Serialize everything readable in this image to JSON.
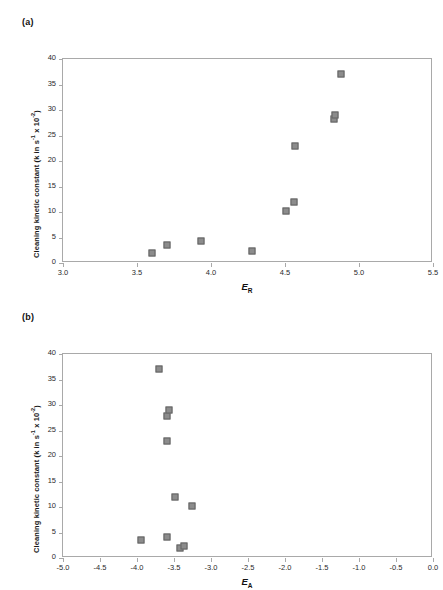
{
  "figure": {
    "background": "#ffffff",
    "marker_color": "#8c8c8c",
    "marker_border_color": "#636363",
    "axis_color": "#a9a9a9",
    "caption_partial": ""
  },
  "panels": [
    {
      "key": "a",
      "label": "(a)",
      "ylabel_main": "Cleaning kinetic constant (k in s",
      "ylabel_sup1": "-1",
      "ylabel_mid": " x 10",
      "ylabel_sup2": "-2",
      "ylabel_end": ")",
      "xlabel_main": "E",
      "xlabel_sub": "R"
    },
    {
      "key": "b",
      "label": "(b)",
      "ylabel_main": "Cleaning kinetic constant (k in s",
      "ylabel_sup1": "-1",
      "ylabel_mid": " x 10",
      "ylabel_sup2": "-2",
      "ylabel_end": ")",
      "xlabel_main": "E",
      "xlabel_sub": "A"
    }
  ],
  "chart_data": [
    {
      "type": "scatter",
      "panel": "a",
      "title": "",
      "xlabel": "E_R",
      "ylabel": "Cleaning kinetic constant (k in s^-1 x 10^-2)",
      "xlim": [
        3.0,
        5.5
      ],
      "ylim": [
        0,
        40
      ],
      "xticks": [
        3.0,
        3.5,
        4.0,
        4.5,
        5.0,
        5.5
      ],
      "xtick_labels": [
        "3.0",
        "3.5",
        "4.0",
        "4.5",
        "5.0",
        "5.5"
      ],
      "yticks": [
        0,
        5,
        10,
        15,
        20,
        25,
        30,
        35,
        40
      ],
      "ytick_labels": [
        "0",
        "5",
        "10",
        "15",
        "20",
        "25",
        "30",
        "35",
        "40"
      ],
      "grid": false,
      "legend": false,
      "series": [
        {
          "name": "cleaning kinetic constant",
          "marker": "square",
          "points": [
            {
              "x": 3.6,
              "y": 2.0
            },
            {
              "x": 3.7,
              "y": 3.5
            },
            {
              "x": 3.93,
              "y": 4.3
            },
            {
              "x": 4.28,
              "y": 2.3
            },
            {
              "x": 4.51,
              "y": 10.1
            },
            {
              "x": 4.56,
              "y": 12.0
            },
            {
              "x": 4.57,
              "y": 23.0
            },
            {
              "x": 4.83,
              "y": 28.2
            },
            {
              "x": 4.84,
              "y": 29.1
            },
            {
              "x": 4.88,
              "y": 37.0
            }
          ]
        }
      ]
    },
    {
      "type": "scatter",
      "panel": "b",
      "title": "",
      "xlabel": "E_A",
      "ylabel": "Cleaning kinetic constant (k in s^-1 x 10^-2)",
      "xlim": [
        -5.0,
        0.0
      ],
      "ylim": [
        0,
        40
      ],
      "xticks": [
        -5.0,
        -4.5,
        -4.0,
        -3.5,
        -3.0,
        -2.5,
        -2.0,
        -1.5,
        -1.0,
        -0.5,
        0.0
      ],
      "xtick_labels": [
        "-5.0",
        "-4.5",
        "-4.0",
        "-3.5",
        "-3.0",
        "-2.5",
        "-2.0",
        "-1.5",
        "-1.0",
        "-0.5",
        "0.0"
      ],
      "yticks": [
        0,
        5,
        10,
        15,
        20,
        25,
        30,
        35,
        40
      ],
      "ytick_labels": [
        "0",
        "5",
        "10",
        "15",
        "20",
        "25",
        "30",
        "35",
        "40"
      ],
      "grid": false,
      "legend": false,
      "series": [
        {
          "name": "cleaning kinetic constant",
          "marker": "square",
          "points": [
            {
              "x": -3.95,
              "y": 3.5
            },
            {
              "x": -3.6,
              "y": 4.2
            },
            {
              "x": -3.42,
              "y": 2.0
            },
            {
              "x": -3.36,
              "y": 2.3
            },
            {
              "x": -3.49,
              "y": 12.0
            },
            {
              "x": -3.26,
              "y": 10.1
            },
            {
              "x": -3.6,
              "y": 23.0
            },
            {
              "x": -3.6,
              "y": 27.9
            },
            {
              "x": -3.57,
              "y": 29.0
            },
            {
              "x": -3.7,
              "y": 37.0
            }
          ]
        }
      ]
    }
  ]
}
